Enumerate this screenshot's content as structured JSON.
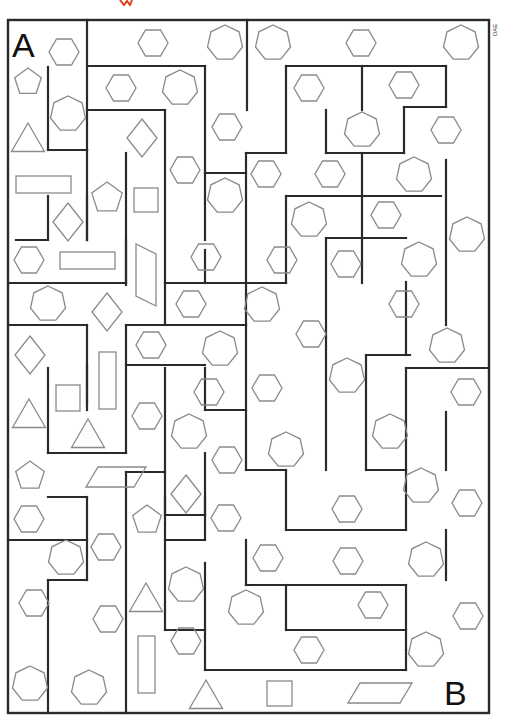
{
  "puzzle": {
    "type": "maze",
    "start_label": "A",
    "end_label": "B",
    "credit": "DAE",
    "colors": {
      "wall": "#2a2a2a",
      "shape_outline": "#8a8a8a",
      "background": "#ffffff",
      "mark": "#e0401a"
    },
    "border": {
      "x": 8,
      "y": 20,
      "w": 481,
      "h": 693
    },
    "walls": [
      [
        87,
        20,
        87,
        150
      ],
      [
        48,
        67,
        48,
        150
      ],
      [
        48,
        150,
        87,
        150
      ],
      [
        87,
        66,
        205,
        66
      ],
      [
        205,
        66,
        205,
        173
      ],
      [
        87,
        110,
        165,
        110
      ],
      [
        165,
        110,
        165,
        283
      ],
      [
        126,
        153,
        126,
        285
      ],
      [
        87,
        150,
        87,
        240
      ],
      [
        247,
        20,
        247,
        110
      ],
      [
        286,
        66,
        446,
        66
      ],
      [
        286,
        66,
        286,
        153
      ],
      [
        246,
        153,
        286,
        153
      ],
      [
        362,
        66,
        362,
        110
      ],
      [
        446,
        66,
        446,
        107
      ],
      [
        404,
        107,
        446,
        107
      ],
      [
        404,
        107,
        404,
        153
      ],
      [
        326,
        153,
        404,
        153
      ],
      [
        326,
        110,
        326,
        153
      ],
      [
        246,
        153,
        246,
        283
      ],
      [
        205,
        173,
        246,
        173
      ],
      [
        205,
        173,
        205,
        240
      ],
      [
        362,
        153,
        362,
        283
      ],
      [
        446,
        160,
        446,
        325
      ],
      [
        286,
        196,
        441,
        196
      ],
      [
        286,
        196,
        286,
        238
      ],
      [
        326,
        238,
        326,
        470
      ],
      [
        326,
        238,
        406,
        238
      ],
      [
        16,
        240,
        48,
        240
      ],
      [
        48,
        196,
        48,
        240
      ],
      [
        87,
        196,
        87,
        240
      ],
      [
        8,
        283,
        126,
        283
      ],
      [
        126,
        240,
        126,
        283
      ],
      [
        165,
        283,
        246,
        283
      ],
      [
        205,
        250,
        205,
        283
      ],
      [
        165,
        283,
        165,
        325
      ],
      [
        246,
        283,
        286,
        283
      ],
      [
        246,
        283,
        246,
        325
      ],
      [
        286,
        240,
        286,
        283
      ],
      [
        48,
        325,
        87,
        325
      ],
      [
        87,
        325,
        87,
        405
      ],
      [
        48,
        368,
        48,
        453
      ],
      [
        48,
        453,
        126,
        453
      ],
      [
        126,
        325,
        126,
        453
      ],
      [
        87,
        365,
        87,
        410
      ],
      [
        8,
        325,
        48,
        325
      ],
      [
        126,
        365,
        205,
        365
      ],
      [
        126,
        325,
        246,
        325
      ],
      [
        246,
        325,
        246,
        470
      ],
      [
        205,
        368,
        205,
        410
      ],
      [
        165,
        368,
        165,
        515
      ],
      [
        165,
        515,
        205,
        515
      ],
      [
        205,
        453,
        205,
        515
      ],
      [
        205,
        410,
        246,
        410
      ],
      [
        126,
        472,
        165,
        472
      ],
      [
        126,
        472,
        126,
        713
      ],
      [
        48,
        497,
        87,
        497
      ],
      [
        87,
        497,
        87,
        580
      ],
      [
        48,
        540,
        87,
        540
      ],
      [
        48,
        580,
        87,
        580
      ],
      [
        48,
        580,
        48,
        713
      ],
      [
        165,
        497,
        165,
        630
      ],
      [
        165,
        540,
        205,
        540
      ],
      [
        205,
        497,
        205,
        540
      ],
      [
        8,
        540,
        48,
        540
      ],
      [
        246,
        470,
        286,
        470
      ],
      [
        286,
        470,
        286,
        530
      ],
      [
        286,
        530,
        406,
        530
      ],
      [
        406,
        470,
        406,
        530
      ],
      [
        366,
        470,
        406,
        470
      ],
      [
        366,
        355,
        366,
        470
      ],
      [
        366,
        355,
        410,
        355
      ],
      [
        406,
        282,
        406,
        355
      ],
      [
        406,
        368,
        446,
        368
      ],
      [
        406,
        368,
        406,
        470
      ],
      [
        446,
        412,
        446,
        470
      ],
      [
        446,
        368,
        489,
        368
      ],
      [
        246,
        540,
        246,
        585
      ],
      [
        246,
        585,
        406,
        585
      ],
      [
        406,
        585,
        406,
        650
      ],
      [
        286,
        585,
        286,
        630
      ],
      [
        286,
        630,
        406,
        630
      ],
      [
        165,
        630,
        205,
        630
      ],
      [
        205,
        563,
        205,
        670
      ],
      [
        205,
        670,
        406,
        670
      ],
      [
        406,
        670,
        406,
        650
      ],
      [
        446,
        530,
        446,
        580
      ]
    ],
    "shapes": [
      {
        "kind": "hexagon",
        "cx": 64,
        "cy": 52,
        "r": 15
      },
      {
        "kind": "hexagon",
        "cx": 153,
        "cy": 43,
        "r": 15
      },
      {
        "kind": "heptagon",
        "cx": 225,
        "cy": 43,
        "r": 18
      },
      {
        "kind": "heptagon",
        "cx": 273,
        "cy": 43,
        "r": 18
      },
      {
        "kind": "hexagon",
        "cx": 361,
        "cy": 43,
        "r": 15
      },
      {
        "kind": "heptagon",
        "cx": 461,
        "cy": 43,
        "r": 18
      },
      {
        "kind": "pentagon",
        "cx": 28,
        "cy": 82,
        "r": 14
      },
      {
        "kind": "hexagon",
        "cx": 121,
        "cy": 88,
        "r": 15
      },
      {
        "kind": "heptagon",
        "cx": 180,
        "cy": 88,
        "r": 18
      },
      {
        "kind": "hexagon",
        "cx": 309,
        "cy": 88,
        "r": 15
      },
      {
        "kind": "hexagon",
        "cx": 404,
        "cy": 85,
        "r": 15
      },
      {
        "kind": "heptagon",
        "cx": 68,
        "cy": 114,
        "r": 18
      },
      {
        "kind": "heptagon",
        "cx": 362,
        "cy": 130,
        "r": 18
      },
      {
        "kind": "hexagon",
        "cx": 227,
        "cy": 127,
        "r": 15
      },
      {
        "kind": "hexagon",
        "cx": 446,
        "cy": 130,
        "r": 15
      },
      {
        "kind": "triangle",
        "cx": 28,
        "cy": 138,
        "r": 16
      },
      {
        "kind": "diamond",
        "cx": 142,
        "cy": 138,
        "w": 30,
        "h": 38
      },
      {
        "kind": "rect",
        "x": 16,
        "y": 176,
        "w": 55,
        "h": 17
      },
      {
        "kind": "pentagon",
        "cx": 107,
        "cy": 198,
        "r": 16
      },
      {
        "kind": "rect",
        "x": 134,
        "y": 188,
        "w": 24,
        "h": 24
      },
      {
        "kind": "hexagon",
        "cx": 185,
        "cy": 170,
        "r": 15
      },
      {
        "kind": "hexagon",
        "cx": 266,
        "cy": 174,
        "r": 15
      },
      {
        "kind": "hexagon",
        "cx": 330,
        "cy": 174,
        "r": 15
      },
      {
        "kind": "heptagon",
        "cx": 414,
        "cy": 175,
        "r": 18
      },
      {
        "kind": "diamond",
        "cx": 68,
        "cy": 222,
        "w": 30,
        "h": 38
      },
      {
        "kind": "heptagon",
        "cx": 225,
        "cy": 196,
        "r": 18
      },
      {
        "kind": "heptagon",
        "cx": 309,
        "cy": 220,
        "r": 18
      },
      {
        "kind": "hexagon",
        "cx": 386,
        "cy": 215,
        "r": 15
      },
      {
        "kind": "heptagon",
        "cx": 467,
        "cy": 235,
        "r": 18
      },
      {
        "kind": "hexagon",
        "cx": 29,
        "cy": 260,
        "r": 15
      },
      {
        "kind": "rect",
        "x": 60,
        "y": 252,
        "w": 55,
        "h": 17
      },
      {
        "kind": "para",
        "x": 136,
        "y": 244,
        "w": 20,
        "h": 62
      },
      {
        "kind": "hexagon",
        "cx": 206,
        "cy": 257,
        "r": 15
      },
      {
        "kind": "hexagon",
        "cx": 282,
        "cy": 260,
        "r": 15
      },
      {
        "kind": "hexagon",
        "cx": 346,
        "cy": 264,
        "r": 15
      },
      {
        "kind": "heptagon",
        "cx": 419,
        "cy": 260,
        "r": 18
      },
      {
        "kind": "heptagon",
        "cx": 48,
        "cy": 304,
        "r": 18
      },
      {
        "kind": "diamond",
        "cx": 107,
        "cy": 312,
        "w": 30,
        "h": 38
      },
      {
        "kind": "hexagon",
        "cx": 191,
        "cy": 304,
        "r": 15
      },
      {
        "kind": "heptagon",
        "cx": 262,
        "cy": 305,
        "r": 18
      },
      {
        "kind": "hexagon",
        "cx": 311,
        "cy": 334,
        "r": 15
      },
      {
        "kind": "hexagon",
        "cx": 404,
        "cy": 304,
        "r": 15
      },
      {
        "kind": "hexagon",
        "cx": 151,
        "cy": 345,
        "r": 15
      },
      {
        "kind": "heptagon",
        "cx": 220,
        "cy": 349,
        "r": 18
      },
      {
        "kind": "diamond",
        "cx": 30,
        "cy": 355,
        "w": 30,
        "h": 38
      },
      {
        "kind": "rect",
        "x": 99,
        "y": 352,
        "w": 17,
        "h": 57
      },
      {
        "kind": "heptagon",
        "cx": 447,
        "cy": 346,
        "r": 18
      },
      {
        "kind": "rect",
        "x": 56,
        "y": 385,
        "w": 24,
        "h": 26
      },
      {
        "kind": "hexagon",
        "cx": 209,
        "cy": 392,
        "r": 15
      },
      {
        "kind": "hexagon",
        "cx": 267,
        "cy": 388,
        "r": 15
      },
      {
        "kind": "heptagon",
        "cx": 347,
        "cy": 376,
        "r": 18
      },
      {
        "kind": "hexagon",
        "cx": 466,
        "cy": 392,
        "r": 15
      },
      {
        "kind": "triangle",
        "cx": 29,
        "cy": 414,
        "r": 16
      },
      {
        "kind": "hexagon",
        "cx": 147,
        "cy": 416,
        "r": 15
      },
      {
        "kind": "heptagon",
        "cx": 189,
        "cy": 432,
        "r": 18
      },
      {
        "kind": "heptagon",
        "cx": 390,
        "cy": 432,
        "r": 18
      },
      {
        "kind": "triangle",
        "cx": 88,
        "cy": 434,
        "r": 16
      },
      {
        "kind": "heptagon",
        "cx": 286,
        "cy": 450,
        "r": 18
      },
      {
        "kind": "hexagon",
        "cx": 227,
        "cy": 460,
        "r": 15
      },
      {
        "kind": "pentagon",
        "cx": 30,
        "cy": 476,
        "r": 15
      },
      {
        "kind": "para",
        "x": 86,
        "y": 467,
        "w": 60,
        "h": 20
      },
      {
        "kind": "diamond",
        "cx": 186,
        "cy": 494,
        "w": 30,
        "h": 38
      },
      {
        "kind": "heptagon",
        "cx": 421,
        "cy": 486,
        "r": 18
      },
      {
        "kind": "hexagon",
        "cx": 29,
        "cy": 519,
        "r": 15
      },
      {
        "kind": "pentagon",
        "cx": 147,
        "cy": 520,
        "r": 15
      },
      {
        "kind": "hexagon",
        "cx": 226,
        "cy": 518,
        "r": 15
      },
      {
        "kind": "hexagon",
        "cx": 347,
        "cy": 509,
        "r": 15
      },
      {
        "kind": "hexagon",
        "cx": 467,
        "cy": 503,
        "r": 15
      },
      {
        "kind": "hexagon",
        "cx": 106,
        "cy": 547,
        "r": 15
      },
      {
        "kind": "heptagon",
        "cx": 66,
        "cy": 558,
        "r": 18
      },
      {
        "kind": "hexagon",
        "cx": 268,
        "cy": 558,
        "r": 15
      },
      {
        "kind": "hexagon",
        "cx": 348,
        "cy": 561,
        "r": 15
      },
      {
        "kind": "heptagon",
        "cx": 426,
        "cy": 560,
        "r": 18
      },
      {
        "kind": "hexagon",
        "cx": 34,
        "cy": 603,
        "r": 15
      },
      {
        "kind": "triangle",
        "cx": 146,
        "cy": 598,
        "r": 16
      },
      {
        "kind": "heptagon",
        "cx": 186,
        "cy": 585,
        "r": 18
      },
      {
        "kind": "heptagon",
        "cx": 246,
        "cy": 608,
        "r": 18
      },
      {
        "kind": "hexagon",
        "cx": 373,
        "cy": 605,
        "r": 15
      },
      {
        "kind": "hexagon",
        "cx": 468,
        "cy": 616,
        "r": 15
      },
      {
        "kind": "hexagon",
        "cx": 108,
        "cy": 619,
        "r": 15
      },
      {
        "kind": "hexagon",
        "cx": 186,
        "cy": 641,
        "r": 15
      },
      {
        "kind": "hexagon",
        "cx": 309,
        "cy": 650,
        "r": 15
      },
      {
        "kind": "heptagon",
        "cx": 426,
        "cy": 650,
        "r": 18
      },
      {
        "kind": "rect",
        "x": 138,
        "y": 636,
        "w": 17,
        "h": 57
      },
      {
        "kind": "heptagon",
        "cx": 30,
        "cy": 684,
        "r": 18
      },
      {
        "kind": "heptagon",
        "cx": 89,
        "cy": 688,
        "r": 18
      },
      {
        "kind": "triangle",
        "cx": 206,
        "cy": 695,
        "r": 16
      },
      {
        "kind": "rect",
        "x": 267,
        "y": 681,
        "w": 25,
        "h": 25
      },
      {
        "kind": "para",
        "x": 348,
        "y": 683,
        "w": 64,
        "h": 20
      }
    ]
  }
}
